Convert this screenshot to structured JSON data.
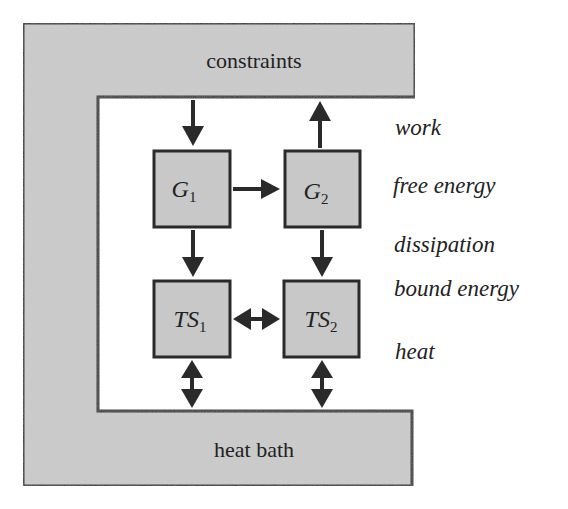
{
  "diagram": {
    "colors": {
      "background": "#ffffff",
      "fill": "#c8c8c8",
      "stroke": "#2a2a2a",
      "text": "#222222"
    },
    "frame": {
      "top_label": "constraints",
      "bottom_label": "heat bath"
    },
    "nodes": {
      "g1": {
        "symbol": "G",
        "subscript": "1"
      },
      "g2": {
        "symbol": "G",
        "subscript": "2"
      },
      "ts1": {
        "symbol": "TS",
        "subscript": "1"
      },
      "ts2": {
        "symbol": "TS",
        "subscript": "2"
      }
    },
    "side_labels": {
      "work": "work",
      "free_energy": "free energy",
      "dissipation": "dissipation",
      "bound_energy": "bound energy",
      "heat": "heat"
    },
    "edges": [
      {
        "from": "constraints",
        "to": "G1",
        "type": "single-arrow"
      },
      {
        "from": "G2",
        "to": "constraints",
        "type": "single-arrow"
      },
      {
        "from": "G1",
        "to": "G2",
        "type": "single-arrow"
      },
      {
        "from": "G1",
        "to": "TS1",
        "type": "single-arrow"
      },
      {
        "from": "G2",
        "to": "TS2",
        "type": "single-arrow"
      },
      {
        "from": "TS1",
        "to": "TS2",
        "type": "double-arrow"
      },
      {
        "from": "TS1",
        "to": "heat bath",
        "type": "double-arrow"
      },
      {
        "from": "TS2",
        "to": "heat bath",
        "type": "double-arrow"
      }
    ]
  }
}
